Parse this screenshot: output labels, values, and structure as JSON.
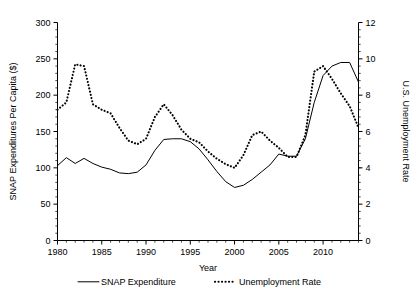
{
  "chart_data": {
    "type": "line",
    "title": "",
    "xlabel": "Year",
    "ylabel": "SNAP Expenditures Per Capita ($)",
    "y2label": "U.S. Unemployment Rate",
    "xlim": [
      1980,
      2014
    ],
    "ylim": [
      0,
      300
    ],
    "y2lim": [
      0,
      12
    ],
    "grid": false,
    "legend_position": "bottom",
    "xticks": [
      1980,
      1985,
      1990,
      1995,
      2000,
      2005,
      2010
    ],
    "xtick_labels": [
      "1980",
      "1985",
      "1990",
      "1995",
      "2000",
      "2005",
      "2010"
    ],
    "xticks_minor_step": 1,
    "yticks": [
      0,
      50,
      100,
      150,
      200,
      250,
      300
    ],
    "ytick_labels": [
      "0",
      "50",
      "100",
      "150",
      "200",
      "250",
      "300"
    ],
    "y2ticks": [
      0,
      2,
      4,
      6,
      8,
      10,
      12
    ],
    "y2tick_labels": [
      "0",
      "2",
      "4",
      "6",
      "8",
      "10",
      "12"
    ],
    "x": [
      1980,
      1981,
      1982,
      1983,
      1984,
      1985,
      1986,
      1987,
      1988,
      1989,
      1990,
      1991,
      1992,
      1993,
      1994,
      1995,
      1996,
      1997,
      1998,
      1999,
      2000,
      2001,
      2002,
      2003,
      2004,
      2005,
      2006,
      2007,
      2008,
      2009,
      2010,
      2011,
      2012,
      2013,
      2014
    ],
    "series": [
      {
        "name": "SNAP Expenditure",
        "axis": "left",
        "style": "solid",
        "values": [
          103,
          114,
          106,
          113,
          106,
          101,
          98,
          93,
          92,
          94,
          104,
          124,
          139,
          140,
          140,
          136,
          126,
          111,
          95,
          81,
          73,
          76,
          84,
          94,
          104,
          119,
          116,
          116,
          140,
          190,
          227,
          240,
          245,
          245,
          218
        ]
      },
      {
        "name": "Unemployment Rate",
        "axis": "right",
        "style": "dotted",
        "values": [
          7.2,
          7.6,
          9.7,
          9.6,
          7.5,
          7.2,
          7.0,
          6.2,
          5.5,
          5.3,
          5.6,
          6.8,
          7.5,
          6.9,
          6.1,
          5.6,
          5.4,
          4.9,
          4.5,
          4.2,
          4.0,
          4.7,
          5.8,
          6.0,
          5.5,
          5.1,
          4.6,
          4.6,
          5.8,
          9.3,
          9.6,
          8.9,
          8.1,
          7.4,
          6.2
        ]
      }
    ],
    "legend": [
      {
        "label": "SNAP Expenditure",
        "style": "solid"
      },
      {
        "label": "Unemployment Rate",
        "style": "dotted"
      }
    ]
  }
}
